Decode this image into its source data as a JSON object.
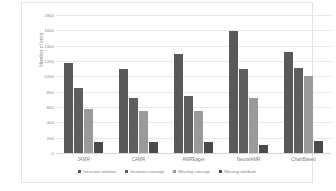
{
  "chart_data": {
    "type": "bar",
    "title": "",
    "xlabel": "",
    "ylabel": "Number of error",
    "ylim": [
      0,
      1800
    ],
    "ytick_step": 200,
    "yticks": [
      "0",
      "200",
      "400",
      "600",
      "800",
      "1000",
      "1200",
      "1400",
      "1600",
      "1800"
    ],
    "grid": true,
    "legend_position": "bottom",
    "categories": [
      "JAMR",
      "CAMR",
      "AMREager",
      "NeuralAMR",
      "ChartBased"
    ],
    "series": [
      {
        "name": "Incorrect relation",
        "color": "#595959",
        "values": [
          1175,
          1095,
          1295,
          1590,
          1320
        ]
      },
      {
        "name": "Incorrect concept",
        "color": "#5e5e5e",
        "values": [
          845,
          715,
          750,
          1095,
          1110
        ]
      },
      {
        "name": "Missing concept",
        "color": "#9a9a9a",
        "values": [
          580,
          545,
          550,
          720,
          1000
        ]
      },
      {
        "name": "Missing attribute",
        "color": "#4a4a4a",
        "values": [
          150,
          148,
          140,
          105,
          162
        ]
      }
    ]
  },
  "legend": {
    "items": [
      {
        "label": "Incorrect relation"
      },
      {
        "label": "Incorrect concept"
      },
      {
        "label": "Missing concept"
      },
      {
        "label": "Missing attribute"
      }
    ]
  }
}
